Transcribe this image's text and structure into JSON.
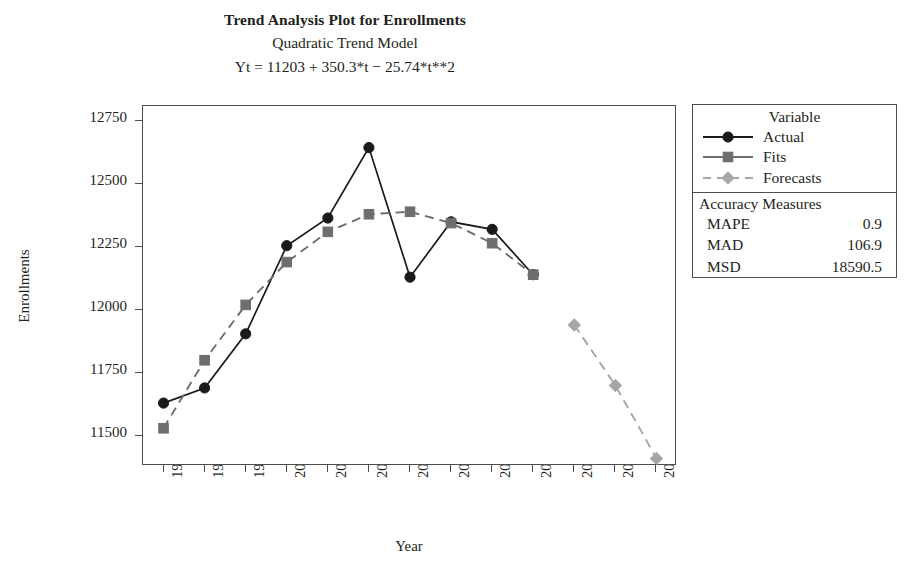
{
  "chart_data": {
    "type": "line",
    "title": "Trend Analysis Plot for Enrollments",
    "subtitle": "Quadratic Trend Model",
    "equation": "Yt = 11203 + 350.3*t − 25.74*t**2",
    "xlabel": "Year",
    "ylabel": "Enrollments",
    "categories": [
      "1997",
      "1998",
      "1999",
      "2000",
      "2001",
      "2002",
      "2003",
      "2004",
      "2005",
      "2006",
      "2007",
      "2008",
      "2009"
    ],
    "ylim": [
      11380,
      12810
    ],
    "yticks": [
      11500,
      11750,
      12000,
      12250,
      12500,
      12750
    ],
    "ytick_labels": [
      "11500",
      "11750",
      "12000",
      "12250",
      "12500",
      "12750"
    ],
    "grid": false,
    "legend_position": "right",
    "series": [
      {
        "name": "Actual",
        "marker": "circle",
        "linestyle": "solid",
        "color": "#1a1a1a",
        "x": [
          "1997",
          "1998",
          "1999",
          "2000",
          "2001",
          "2002",
          "2003",
          "2004",
          "2005",
          "2006"
        ],
        "values": [
          11630,
          11690,
          11905,
          12255,
          12365,
          12645,
          12130,
          12350,
          12320,
          12140
        ]
      },
      {
        "name": "Fits",
        "marker": "square",
        "linestyle": "dashed",
        "color": "#6e6e6e",
        "x": [
          "1997",
          "1998",
          "1999",
          "2000",
          "2001",
          "2002",
          "2003",
          "2004",
          "2005",
          "2006"
        ],
        "values": [
          11530,
          11800,
          12020,
          12190,
          12310,
          12380,
          12390,
          12345,
          12265,
          12140
        ]
      },
      {
        "name": "Forecasts",
        "marker": "diamond",
        "linestyle": "dashed",
        "color": "#a6a6a6",
        "x": [
          "2007",
          "2008",
          "2009"
        ],
        "values": [
          11940,
          11700,
          11410
        ]
      }
    ]
  },
  "legend": {
    "title": "Variable",
    "entries": [
      {
        "label": "Actual",
        "marker": "circle",
        "linestyle": "solid",
        "color": "#1a1a1a"
      },
      {
        "label": "Fits",
        "marker": "square",
        "linestyle": "solid",
        "color": "#6e6e6e"
      },
      {
        "label": "Forecasts",
        "marker": "diamond",
        "linestyle": "dashed",
        "color": "#a6a6a6"
      }
    ]
  },
  "accuracy": {
    "title": "Accuracy Measures",
    "rows": [
      {
        "name": "MAPE",
        "value": "0.9"
      },
      {
        "name": "MAD",
        "value": "106.9"
      },
      {
        "name": "MSD",
        "value": "18590.5"
      }
    ]
  }
}
